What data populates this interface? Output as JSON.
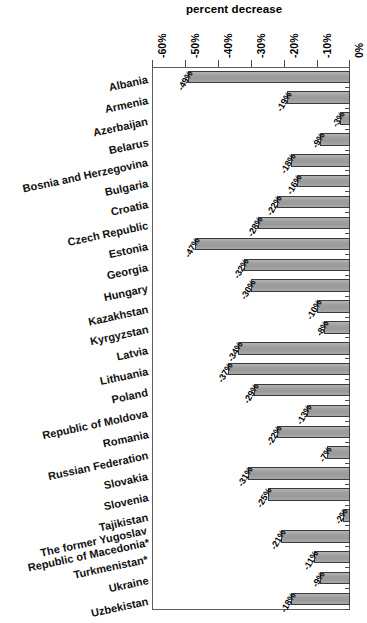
{
  "chart_data": {
    "type": "bar",
    "orientation": "horizontal",
    "title": "percent decrease",
    "xlabel": "",
    "ylabel": "",
    "xlim": [
      -60,
      0
    ],
    "xticks": [
      "-60%",
      "-50%",
      "-40%",
      "-30%",
      "-20%",
      "-10%",
      "0%"
    ],
    "xtick_values": [
      -60,
      -50,
      -40,
      -30,
      -20,
      -10,
      0
    ],
    "grid": false,
    "legend": "none",
    "value_label_suffix": "%",
    "categories": [
      "Albania",
      "Armenia",
      "Azerbaijan",
      "Belarus",
      "Bosnia and Herzegovina",
      "Bulgaria",
      "Croatia",
      "Czech Republic",
      "Estonia",
      "Georgia",
      "Hungary",
      "Kazakhstan",
      "Kyrgyzstan",
      "Latvia",
      "Lithuania",
      "Poland",
      "Republic of Moldova",
      "Romania",
      "Russian Federation",
      "Slovakia",
      "Slovenia",
      "Tajikistan",
      "The former Yugoslav Republic of Macedonia*",
      "Turkmenistan*",
      "Ukraine",
      "Uzbekistan"
    ],
    "values": [
      -49,
      -19,
      -3,
      -9,
      -18,
      -16,
      -22,
      -28,
      -47,
      -32,
      -30,
      -10,
      -8,
      -34,
      -37,
      -29,
      -13,
      -22,
      -7,
      -31,
      -25,
      -2,
      -21,
      -11,
      -9,
      -18
    ],
    "value_labels": [
      "-49%",
      "-19%",
      "-3%",
      "-9%",
      "-18%",
      "-16%",
      "-22%",
      "-28%",
      "-47%",
      "-32%",
      "-30%",
      "-10%",
      "-8%",
      "-34%",
      "-37%",
      "-29%",
      "-13%",
      "-22%",
      "-7%",
      "-31%",
      "-25%",
      "-2%",
      "-21%",
      "-11%",
      "-9%",
      "-18%"
    ],
    "bar_fill_color": "#9a9a9a",
    "bar_border_color": "#3a3a3a",
    "frame_color": "#5d5d5d",
    "text_color": "#111111"
  }
}
